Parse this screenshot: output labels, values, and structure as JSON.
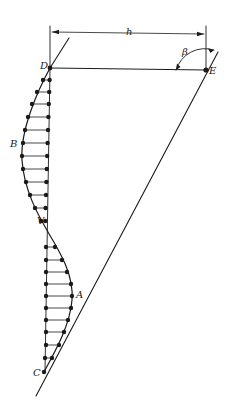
{
  "diagram": {
    "type": "engineering sketch — deflection / pressure profile along a slanted wall",
    "labels": {
      "h": "h",
      "beta": "β",
      "D": "D",
      "E": "E",
      "B": "B",
      "V": "V",
      "A": "A",
      "C": "C"
    },
    "colors": {
      "ink": "#1a1a1a",
      "background": "#ffffff"
    },
    "points": {
      "D": [
        50,
        68
      ],
      "E": [
        206,
        70
      ],
      "B": [
        22,
        157
      ],
      "V": [
        48,
        232
      ],
      "A": [
        72,
        296
      ],
      "C": [
        44,
        372
      ]
    },
    "profile_rows_y": [
      80,
      92,
      104,
      117,
      130,
      143,
      156,
      169,
      182,
      195,
      208,
      221,
      234,
      247,
      260,
      272,
      284,
      296,
      308,
      320,
      332,
      345,
      358
    ]
  }
}
